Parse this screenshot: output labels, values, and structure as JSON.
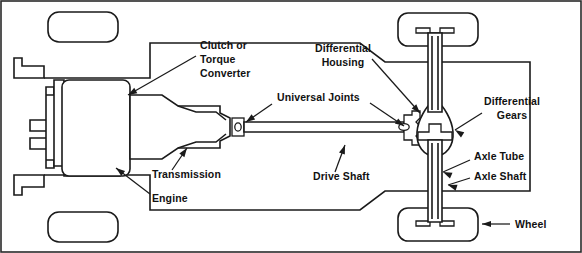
{
  "diagram": {
    "type": "technical-line-diagram",
    "background_color": "#ffffff",
    "line_color": "#1a1a1a",
    "border": true,
    "labels": [
      {
        "id": "clutch-or-torque-converter",
        "lines": [
          "Clutch  or",
          "Torque",
          "Converter"
        ],
        "align": "start",
        "text_x": 200,
        "text_y": 49,
        "line_height": 14,
        "leader": {
          "x1": 196,
          "y1": 56,
          "x2": 128,
          "y2": 95
        },
        "arrow_angle_deg": 150
      },
      {
        "id": "universal-joints",
        "lines": [
          "Universal Joints"
        ],
        "align": "start",
        "text_x": 277,
        "text_y": 101,
        "line_height": 14,
        "leader": {
          "x1": 272,
          "y1": 104,
          "x2": 246,
          "y2": 122
        },
        "arrow_angle_deg": 145
      },
      {
        "id": "universal-joints-right",
        "lines": [],
        "align": "start",
        "text_x": 0,
        "text_y": 0,
        "line_height": 14,
        "leader": {
          "x1": 370,
          "y1": 103,
          "x2": 404,
          "y2": 126
        },
        "arrow_angle_deg": 34
      },
      {
        "id": "differential-housing",
        "lines": [
          "Differential",
          "Housing"
        ],
        "align": "center",
        "text_x": 343,
        "text_y": 52,
        "line_height": 14,
        "leader": {
          "x1": 372,
          "y1": 59,
          "x2": 420,
          "y2": 113
        },
        "arrow_angle_deg": 48
      },
      {
        "id": "differential-gears",
        "lines": [
          "Differential",
          "Gears"
        ],
        "align": "center",
        "text_x": 512,
        "text_y": 105,
        "line_height": 14,
        "leader": {
          "x1": 482,
          "y1": 113,
          "x2": 455,
          "y2": 130
        },
        "arrow_angle_deg": 212
      },
      {
        "id": "axle-tube",
        "lines": [
          "Axle Tube"
        ],
        "align": "start",
        "text_x": 474,
        "text_y": 160,
        "line_height": 14,
        "leader": {
          "x1": 470,
          "y1": 160,
          "x2": 443,
          "y2": 172
        },
        "arrow_angle_deg": 204
      },
      {
        "id": "axle-shaft",
        "lines": [
          "Axle Shaft"
        ],
        "align": "start",
        "text_x": 474,
        "text_y": 180,
        "line_height": 14,
        "leader": {
          "x1": 470,
          "y1": 178,
          "x2": 448,
          "y2": 185
        },
        "arrow_angle_deg": 198
      },
      {
        "id": "transmission",
        "lines": [
          "Transmission"
        ],
        "align": "start",
        "text_x": 152,
        "text_y": 178,
        "line_height": 14,
        "leader": {
          "x1": 172,
          "y1": 170,
          "x2": 187,
          "y2": 148
        },
        "arrow_angle_deg": 305
      },
      {
        "id": "engine",
        "lines": [
          "Engine"
        ],
        "align": "start",
        "text_x": 152,
        "text_y": 202,
        "line_height": 14,
        "leader": {
          "x1": 150,
          "y1": 194,
          "x2": 116,
          "y2": 168
        },
        "arrow_angle_deg": 217
      },
      {
        "id": "drive-shaft",
        "lines": [
          "Drive Shaft"
        ],
        "align": "start",
        "text_x": 313,
        "text_y": 180,
        "line_height": 14,
        "leader": {
          "x1": 335,
          "y1": 172,
          "x2": 345,
          "y2": 145
        },
        "arrow_angle_deg": 290
      },
      {
        "id": "wheel",
        "lines": [
          "Wheel"
        ],
        "align": "start",
        "text_x": 515,
        "text_y": 228,
        "line_height": 14,
        "leader": {
          "x1": 510,
          "y1": 224,
          "x2": 482,
          "y2": 224
        },
        "arrow_angle_deg": 180
      }
    ],
    "components": [
      {
        "id": "front-wheel-left",
        "name": "front wheel (upper)"
      },
      {
        "id": "front-wheel-right",
        "name": "front wheel (lower)"
      },
      {
        "id": "rear-wheel-upper",
        "name": "rear wheel (upper)"
      },
      {
        "id": "rear-wheel-lower",
        "name": "rear wheel (lower)"
      },
      {
        "id": "engine-block",
        "name": "engine block"
      },
      {
        "id": "transmission-body",
        "name": "transmission housing"
      },
      {
        "id": "drive-shaft-tube",
        "name": "drive shaft"
      },
      {
        "id": "universal-joint-front",
        "name": "front universal joint"
      },
      {
        "id": "universal-joint-rear",
        "name": "rear universal joint"
      },
      {
        "id": "differential-housing-body",
        "name": "differential housing"
      },
      {
        "id": "differential-gear-set",
        "name": "differential gears"
      },
      {
        "id": "axle-assembly",
        "name": "axle tube and shaft"
      },
      {
        "id": "vehicle-body",
        "name": "vehicle body outline"
      }
    ]
  }
}
